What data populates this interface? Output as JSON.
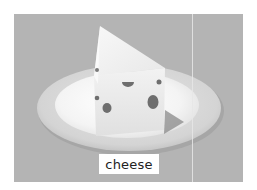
{
  "flashcard": {
    "label": "cheese",
    "image_subject": "cheese-wedge-on-plate",
    "colors": {
      "background": "#b4b4b4",
      "plate_rim": "#d2d2d2",
      "plate_inner": "#f2f2f2",
      "cheese": "#f4f4f4",
      "holes": "#6e6e6e",
      "label_bg": "#ffffff",
      "label_text": "#222222"
    }
  }
}
